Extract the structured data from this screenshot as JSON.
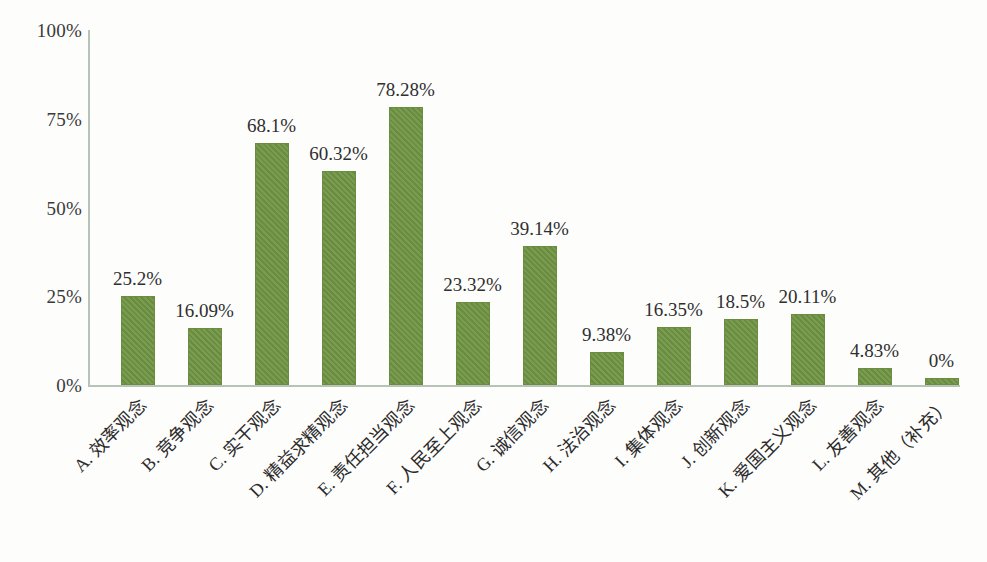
{
  "chart_data": {
    "type": "bar",
    "title": "",
    "subtitle": "",
    "xlabel": "",
    "ylabel": "",
    "ylim": [
      0,
      100
    ],
    "ytick_labels": [
      "0%",
      "25%",
      "50%",
      "75%",
      "100%"
    ],
    "ytick_values": [
      0,
      25,
      50,
      75,
      100
    ],
    "grid": false,
    "legend": null,
    "legend_position": "none",
    "bar_color": "#6f9443",
    "axis_color": "#b9c2b9",
    "categories": [
      "A. 效率观念",
      "B. 竞争观念",
      "C. 实干观念",
      "D. 精益求精观念",
      "E. 责任担当观念",
      "F. 人民至上观念",
      "G. 诚信观念",
      "H. 法治观念",
      "I. 集体观念",
      "J. 创新观念",
      "K. 爱国主义观念",
      "L. 友善观念",
      "M. 其他（补充）"
    ],
    "values": [
      25.2,
      16.09,
      68.1,
      60.32,
      78.28,
      23.32,
      39.14,
      9.38,
      16.35,
      18.5,
      20.11,
      4.83,
      0
    ],
    "value_labels": [
      "25.2%",
      "16.09%",
      "68.1%",
      "60.32%",
      "78.28%",
      "23.32%",
      "39.14%",
      "9.38%",
      "16.35%",
      "18.5%",
      "20.11%",
      "4.83%",
      "0%"
    ]
  }
}
